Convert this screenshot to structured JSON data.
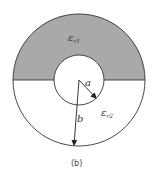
{
  "figure": {
    "caption": "(b)",
    "labels": {
      "region_top": "ε",
      "region_top_sub": "r1",
      "region_bottom": "ε",
      "region_bottom_sub": "r2",
      "inner_radius": "a",
      "outer_radius": "b"
    },
    "colors": {
      "top_fill": "#a9a9a9",
      "bottom_fill": "#ffffff",
      "stroke": "#333333"
    },
    "geometry": {
      "center": [
        79,
        80
      ],
      "outer_radius": 66,
      "inner_radius": 25
    }
  }
}
